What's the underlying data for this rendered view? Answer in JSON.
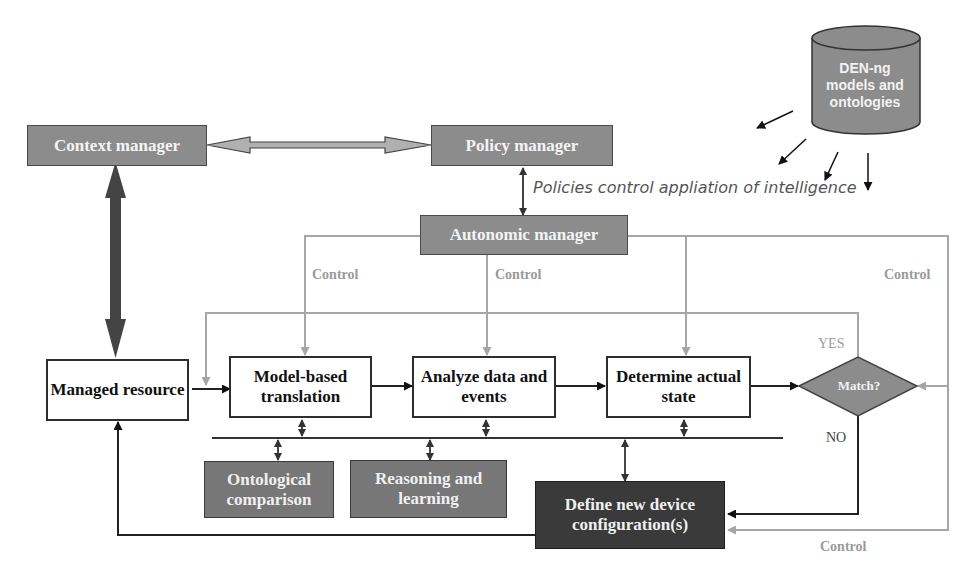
{
  "diagram": {
    "nodes": {
      "context_manager": "Context manager",
      "policy_manager": "Policy manager",
      "autonomic_manager": "Autonomic manager",
      "managed_resource": "Managed resource",
      "model_based_translation": "Model-based translation",
      "analyze_data_events": "Analyze data and events",
      "determine_actual_state": "Determine actual state",
      "match_decision": "Match?",
      "ontological_comparison": "Ontological comparison",
      "reasoning_learning": "Reasoning and learning",
      "define_new_config": "Define new device configuration(s)",
      "database": "DEN-ng models and ontologies"
    },
    "labels": {
      "policy_annotation": "Policies control appliation of intelligence",
      "control_1": "Control",
      "control_2": "Control",
      "control_3": "Control",
      "control_4": "Control",
      "yes": "YES",
      "no": "NO"
    },
    "colors": {
      "gray_box": "#8c8c8c",
      "mid_box": "#777777",
      "dark_box": "#3a3a3a",
      "control_line": "#a6a6a6",
      "flow_line": "#333333"
    }
  }
}
